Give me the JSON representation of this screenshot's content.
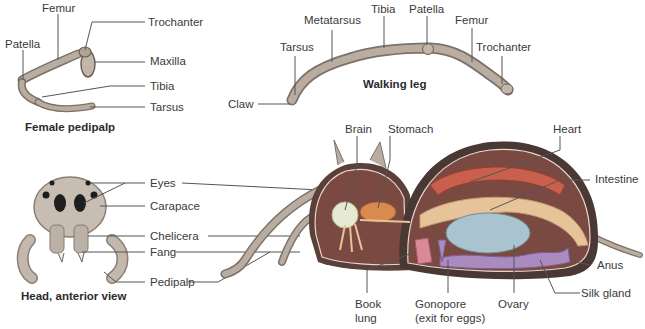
{
  "diagram": {
    "panels": {
      "pedipalp": {
        "caption": "Female pedipalp",
        "labels": {
          "femur": "Femur",
          "patella": "Patella",
          "trochanter": "Trochanter",
          "maxilla": "Maxilla",
          "tibia": "Tibia",
          "tarsus": "Tarsus"
        }
      },
      "walking_leg": {
        "caption": "Walking leg",
        "labels": {
          "claw": "Claw",
          "tarsus": "Tarsus",
          "metatarsus": "Metatarsus",
          "tibia": "Tibia",
          "patella": "Patella",
          "femur": "Femur",
          "trochanter": "Trochanter"
        }
      },
      "head": {
        "caption": "Head, anterior view",
        "labels": {
          "eyes": "Eyes",
          "carapace": "Carapace",
          "chelicera": "Chelicera",
          "fang": "Fang",
          "pedipalp": "Pedipalp"
        }
      },
      "body": {
        "labels": {
          "brain": "Brain",
          "stomach": "Stomach",
          "heart": "Heart",
          "intestine": "Intestine",
          "anus": "Anus",
          "silk_gland": "Silk gland",
          "ovary": "Ovary",
          "gonopore_1": "Gonopore",
          "gonopore_2": "(exit for eggs)",
          "book_lung_1": "Book",
          "book_lung_2": "lung"
        }
      }
    },
    "colors": {
      "leg": "#b9ada2",
      "leg_dark": "#7d7168",
      "body_wall": "#5b3f3a",
      "cavity": "#7a4a42",
      "heart": "#c9604e",
      "intestine": "#e7c39a",
      "ovary": "#a9c4cf",
      "silk_gland": "#a98bc0",
      "brain": "#e6ead2",
      "stomach": "#d98a4e",
      "book_lung": "#d98a96",
      "line": "#444444"
    }
  }
}
